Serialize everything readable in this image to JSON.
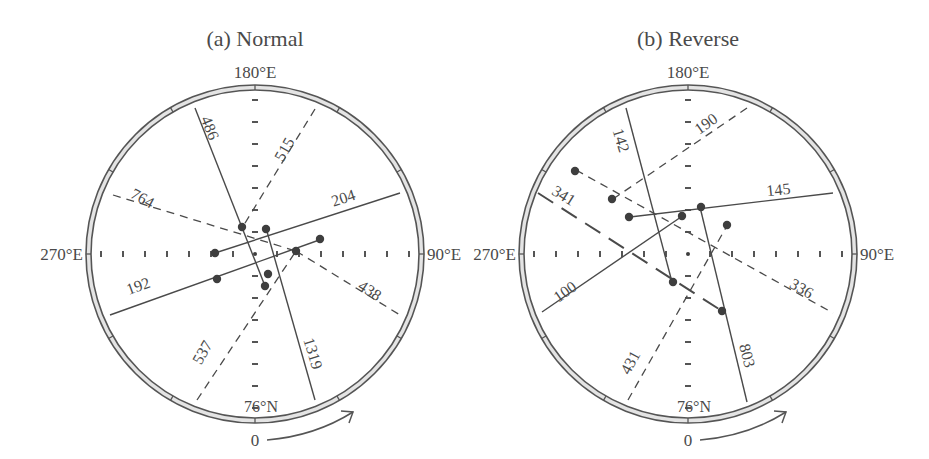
{
  "panels": [
    {
      "id": "a",
      "title": "(a) Normal",
      "center": [
        255,
        254
      ],
      "radius": 164,
      "labels": {
        "top": "180°E",
        "left": "270°E",
        "right": "90°E",
        "bottom": "76°N",
        "arrow_start": "0"
      },
      "lines": [
        {
          "label": "486",
          "style": "solid",
          "from": [
            195,
            108
          ],
          "to": [
            265,
            286
          ],
          "label_pos": [
            205,
            130
          ],
          "label_rot": 68
        },
        {
          "label": "1319",
          "style": "solid",
          "from": [
            266,
            228
          ],
          "to": [
            315,
            400
          ],
          "label_pos": [
            308,
            355
          ],
          "label_rot": 73
        },
        {
          "label": "204",
          "style": "solid",
          "from": [
            215,
            253
          ],
          "to": [
            400,
            193
          ],
          "label_pos": [
            345,
            203
          ],
          "label_rot": -18
        },
        {
          "label": "192",
          "style": "solid",
          "from": [
            110,
            315
          ],
          "to": [
            322,
            239
          ],
          "label_pos": [
            140,
            291
          ],
          "label_rot": -20
        },
        {
          "label": "515",
          "style": "dash",
          "from": [
            315,
            109
          ],
          "to": [
            242,
            228
          ],
          "label_pos": [
            289,
            152
          ],
          "label_rot": -60
        },
        {
          "label": "764",
          "style": "dash",
          "from": [
            113,
            195
          ],
          "to": [
            296,
            251
          ],
          "label_pos": [
            140,
            203
          ],
          "label_rot": 28
        },
        {
          "label": "438",
          "style": "dash",
          "from": [
            296,
            251
          ],
          "to": [
            400,
            315
          ],
          "label_pos": [
            367,
            295
          ],
          "label_rot": 33
        },
        {
          "label": "537",
          "style": "dash",
          "from": [
            197,
            400
          ],
          "to": [
            296,
            251
          ],
          "label_pos": [
            207,
            355
          ],
          "label_rot": -60
        }
      ],
      "dots": [
        [
          242,
          227
        ],
        [
          266,
          229
        ],
        [
          215,
          253
        ],
        [
          320,
          239
        ],
        [
          296,
          251
        ],
        [
          217,
          279
        ],
        [
          268,
          274
        ],
        [
          265,
          286
        ]
      ]
    },
    {
      "id": "b",
      "title": "(b) Reverse",
      "center": [
        688,
        254
      ],
      "radius": 164,
      "labels": {
        "top": "180°E",
        "left": "270°E",
        "right": "90°E",
        "bottom": "76°N",
        "arrow_start": "0"
      },
      "lines": [
        {
          "label": "142",
          "style": "solid",
          "from": [
            626,
            108
          ],
          "to": [
            672,
            282
          ],
          "label_pos": [
            616,
            142
          ],
          "label_rot": 73
        },
        {
          "label": "803",
          "style": "solid",
          "from": [
            700,
            207
          ],
          "to": [
            747,
            402
          ],
          "label_pos": [
            742,
            357
          ],
          "label_rot": 75
        },
        {
          "label": "145",
          "style": "solid",
          "from": [
            630,
            217
          ],
          "to": [
            833,
            193
          ],
          "label_pos": [
            779,
            195
          ],
          "label_rot": -6
        },
        {
          "label": "100",
          "style": "solid",
          "from": [
            542,
            312
          ],
          "to": [
            681,
            217
          ],
          "label_pos": [
            568,
            296
          ],
          "label_rot": -35
        },
        {
          "label": "190",
          "style": "dash",
          "from": [
            747,
            108
          ],
          "to": [
            613,
            199
          ],
          "label_pos": [
            709,
            128
          ],
          "label_rot": -35
        },
        {
          "label": "431",
          "style": "dash",
          "from": [
            628,
            400
          ],
          "to": [
            728,
            224
          ],
          "label_pos": [
            635,
            365
          ],
          "label_rot": -62
        },
        {
          "label": "336",
          "style": "dash",
          "from": [
            576,
            170
          ],
          "to": [
            833,
            313
          ],
          "label_pos": [
            799,
            293
          ],
          "label_rot": 30
        },
        {
          "label": "341",
          "style": "ldash",
          "from": [
            538,
            193
          ],
          "to": [
            722,
            311
          ],
          "label_pos": [
            561,
            200
          ],
          "label_rot": 32
        }
      ],
      "dots": [
        [
          575,
          171
        ],
        [
          612,
          199
        ],
        [
          629,
          217
        ],
        [
          682,
          216
        ],
        [
          701,
          207
        ],
        [
          727,
          225
        ],
        [
          673,
          282
        ],
        [
          722,
          311
        ]
      ]
    }
  ]
}
